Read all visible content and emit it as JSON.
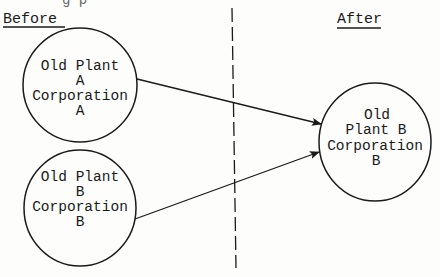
{
  "diagram": {
    "truncated_top_text": "g p",
    "sections": {
      "before_label": "Before",
      "after_label": "After"
    },
    "nodes": [
      {
        "id": "old-plant-a-corp-a",
        "side": "before",
        "lines": [
          "Old Plant",
          "A",
          "Corporation",
          "A"
        ]
      },
      {
        "id": "old-plant-b-corp-b-before",
        "side": "before",
        "lines": [
          "Old Plant",
          "B",
          "Corporation",
          "B"
        ]
      },
      {
        "id": "old-plant-b-corp-b-after",
        "side": "after",
        "lines": [
          "Old",
          "Plant B",
          "Corporation",
          "B"
        ]
      }
    ],
    "edges": [
      {
        "from": "old-plant-a-corp-a",
        "to": "old-plant-b-corp-b-after",
        "type": "arrow"
      },
      {
        "from": "old-plant-b-corp-b-before",
        "to": "old-plant-b-corp-b-after",
        "type": "arrow"
      }
    ],
    "colors": {
      "ink": "#1a1a1a",
      "paper": "#fdfdfc"
    }
  }
}
